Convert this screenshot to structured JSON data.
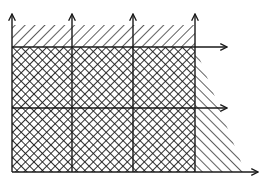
{
  "diagram": {
    "type": "region-grid",
    "colors": {
      "line": "#1a1a1a",
      "background": "#ffffff"
    },
    "grid": {
      "columns_x": [
        12,
        72,
        133,
        195
      ],
      "rows_y": [
        47,
        108,
        172
      ],
      "top_band_y": 25
    },
    "vertical_arrows": [
      {
        "x": 12,
        "from_y": 172,
        "to_y": 14
      },
      {
        "x": 72,
        "from_y": 172,
        "to_y": 14
      },
      {
        "x": 133,
        "from_y": 172,
        "to_y": 14
      },
      {
        "x": 195,
        "from_y": 172,
        "to_y": 14
      }
    ],
    "horizontal_arrows": [
      {
        "y": 47,
        "from_x": 12,
        "to_x": 227
      },
      {
        "y": 108,
        "from_x": 12,
        "to_x": 227
      },
      {
        "y": 172,
        "from_x": 12,
        "to_x": 258
      }
    ],
    "regions": [
      {
        "name": "top-band",
        "pattern": "single-hatch"
      },
      {
        "name": "grid-cells",
        "pattern": "cross-hatch",
        "rows": 2,
        "cols": 3
      },
      {
        "name": "right-wedge",
        "pattern": "single-hatch-reverse"
      }
    ]
  }
}
